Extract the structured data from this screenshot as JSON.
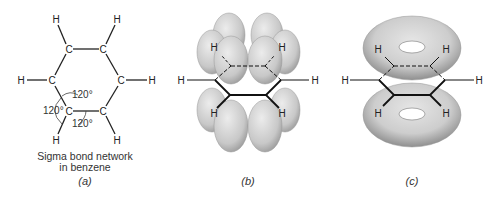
{
  "figure": {
    "panels": [
      {
        "id": "a",
        "label": "(a)",
        "caption_line1": "Sigma bond network",
        "caption_line2": "in benzene",
        "atoms": {
          "carbon": "C",
          "hydrogen": "H"
        },
        "angles": [
          "120°",
          "120°",
          "120°"
        ]
      },
      {
        "id": "b",
        "label": "(b)",
        "atoms": {
          "hydrogen": "H"
        },
        "description": "Six p orbitals above and below the benzene ring"
      },
      {
        "id": "c",
        "label": "(c)",
        "atoms": {
          "hydrogen": "H"
        },
        "description": "Delocalized pi electron clouds (torus shapes) above and below the ring"
      }
    ],
    "colors": {
      "orbital_fill": "#d4d4d4",
      "orbital_shade": "#a8a8a8",
      "bond_line": "#111111"
    }
  }
}
